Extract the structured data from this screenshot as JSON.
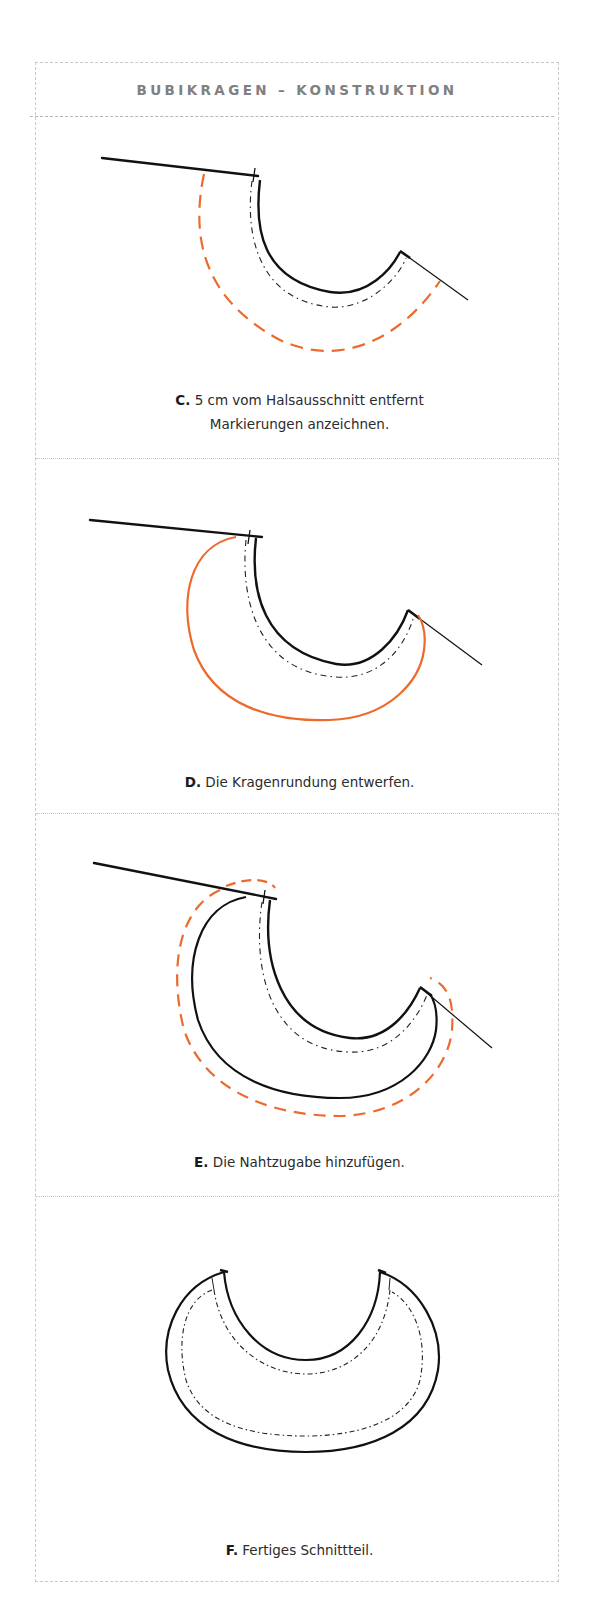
{
  "title": "BUBIKRAGEN – KONSTRUKTION",
  "colors": {
    "accent": "#ec6a2c",
    "ink": "#111111",
    "title_gray": "#808080",
    "border_gray": "#c9c9c9"
  },
  "steps": [
    {
      "letter": "C.",
      "text_line1": "5 cm vom Halsausschnitt entfernt",
      "text_line2": "Markierungen anzeichnen."
    },
    {
      "letter": "D.",
      "text_line1": "Die Kragenrundung entwerfen."
    },
    {
      "letter": "E.",
      "text_line1": "Die Nahtzugabe hinzufügen."
    },
    {
      "letter": "F.",
      "text_line1": "Fertiges Schnittteil."
    }
  ]
}
